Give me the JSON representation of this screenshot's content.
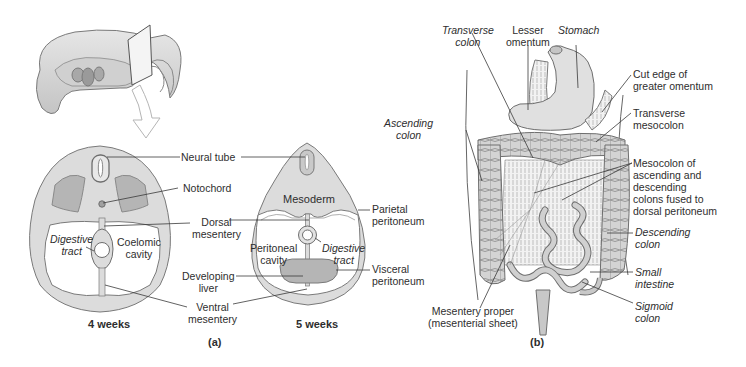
{
  "figure": {
    "panel_a": {
      "caption": "(a)",
      "section_4wk": {
        "title": "4 weeks",
        "labels": {
          "neural_tube": "Neural tube",
          "notochord": "Notochord",
          "dorsal_mesentery_1": "Dorsal",
          "dorsal_mesentery_2": "mesentery",
          "digestive_tract_1": "Digestive",
          "digestive_tract_2": "tract",
          "coelomic_cavity_1": "Coelomic",
          "coelomic_cavity_2": "cavity",
          "developing_liver_1": "Developing",
          "developing_liver_2": "liver",
          "ventral_mesentery_1": "Ventral",
          "ventral_mesentery_2": "mesentery"
        }
      },
      "section_5wk": {
        "title": "5 weeks",
        "labels": {
          "mesoderm": "Mesoderm",
          "parietal_peritoneum_1": "Parietal",
          "parietal_peritoneum_2": "peritoneum",
          "peritoneal_cavity_1": "Peritoneal",
          "peritoneal_cavity_2": "cavity",
          "digestive_tract_1": "Digestive",
          "digestive_tract_2": "tract",
          "visceral_peritoneum_1": "Visceral",
          "visceral_peritoneum_2": "peritoneum"
        }
      }
    },
    "panel_b": {
      "caption": "(b)",
      "labels": {
        "transverse_colon_1": "Transverse",
        "transverse_colon_2": "colon",
        "lesser_omentum_1": "Lesser",
        "lesser_omentum_2": "omentum",
        "stomach": "Stomach",
        "cut_edge_1": "Cut edge of",
        "cut_edge_2": "greater omentum",
        "transverse_mesocolon_1": "Transverse",
        "transverse_mesocolon_2": "mesocolon",
        "mesocolon_1": "Mesocolon of",
        "mesocolon_2": "ascending and",
        "mesocolon_3": "descending",
        "mesocolon_4": "colons fused to",
        "mesocolon_5": "dorsal peritoneum",
        "ascending_colon_1": "Ascending",
        "ascending_colon_2": "colon",
        "descending_colon_1": "Descending",
        "descending_colon_2": "colon",
        "small_intestine_1": "Small",
        "small_intestine_2": "intestine",
        "sigmoid_colon_1": "Sigmoid",
        "sigmoid_colon_2": "colon",
        "mesentery_proper_1": "Mesentery proper",
        "mesentery_proper_2": "(mesenterial sheet)"
      }
    },
    "colors": {
      "tissue_light": "#dcdcdc",
      "tissue_mid": "#b9b9b9",
      "tissue_dark": "#9a9a9a",
      "outline": "#6e6e6e",
      "cavity": "#ffffff",
      "leader": "#3a3a3a"
    }
  }
}
